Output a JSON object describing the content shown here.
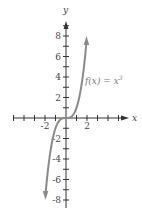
{
  "chart_data": {
    "type": "line",
    "title": "",
    "xlabel": "x",
    "ylabel": "y",
    "xlim": [
      -5,
      5.5
    ],
    "ylim": [
      -8.5,
      9.5
    ],
    "x_tick_step": 1,
    "y_tick_step": 1,
    "x_tick_labels": [
      {
        "value": -2,
        "label": "-2"
      },
      {
        "value": 2,
        "label": "2"
      }
    ],
    "y_tick_labels": [
      {
        "value": 8,
        "label": "8"
      },
      {
        "value": 6,
        "label": "6"
      },
      {
        "value": 4,
        "label": "4"
      },
      {
        "value": 2,
        "label": "2"
      },
      {
        "value": -2,
        "label": "-2"
      },
      {
        "value": -4,
        "label": "-4"
      },
      {
        "value": -6,
        "label": "-6"
      },
      {
        "value": -8,
        "label": "-8"
      }
    ],
    "grid": false,
    "series": [
      {
        "name": "f(x) = x^3",
        "label_text": "f(x) = x",
        "label_superscript": "3",
        "color": "#8a8a8a",
        "x": [
          -1.95,
          -1.5,
          -1,
          -0.5,
          0,
          0.5,
          1,
          1.5,
          1.95
        ],
        "values": [
          -7.41,
          -3.375,
          -1,
          -0.125,
          0,
          0.125,
          1,
          3.375,
          7.41
        ],
        "arrows_at_ends": true
      }
    ]
  },
  "axes": {
    "axis_color": "#333333",
    "curve_color": "#8a8a8a"
  }
}
